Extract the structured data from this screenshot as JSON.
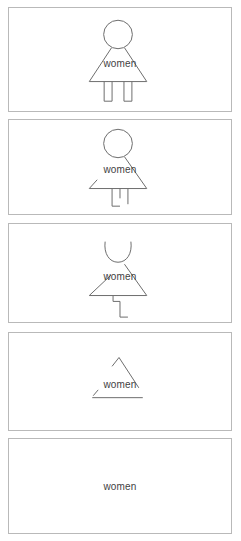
{
  "caption": {
    "text": "Sign fades",
    "note": "clipped at top edge of screenshot"
  },
  "colors": {
    "page_background": "#ffffff",
    "panel_border": "#b9b9b9",
    "figure_stroke": "#6e6e6e",
    "label_text": "#3f3f3f",
    "caption_text": "#4a4a4a"
  },
  "label": {
    "text": "women"
  },
  "frames": [
    {
      "index": 1,
      "name": "frame-complete",
      "label": "women",
      "description": "Complete pictogram: full circular head, full triangular dress, two full legs",
      "erosion_stage": "0% eroded",
      "parts_visible": [
        "head-circle-full",
        "dress-left-diagonal",
        "dress-right-diagonal",
        "dress-hem",
        "leg-left",
        "leg-right"
      ]
    },
    {
      "index": 2,
      "name": "frame-fading-1",
      "label": "women",
      "description": "Dress left diagonal reduced to short stub; legs thinned to strokes with one partial foot",
      "erosion_stage": "25% eroded",
      "parts_visible": [
        "head-circle-full",
        "dress-left-stub",
        "dress-right-diagonal",
        "dress-hem",
        "leg-strokes"
      ]
    },
    {
      "index": 3,
      "name": "frame-fading-2",
      "label": "women",
      "description": "Head circle broken open at the top; single L-shaped leg remnant remains",
      "erosion_stage": "50% eroded",
      "parts_visible": [
        "head-circle-broken",
        "dress-left-stub",
        "dress-right-diagonal",
        "dress-hem",
        "leg-single-remnant"
      ]
    },
    {
      "index": 4,
      "name": "frame-fading-3",
      "label": "women",
      "description": "Head gone; only a small peak, one diagonal, a tiny stub and the hem line remain",
      "erosion_stage": "80% eroded",
      "parts_visible": [
        "dress-peak-fragment",
        "dress-right-diagonal",
        "dress-left-tick",
        "dress-hem"
      ]
    },
    {
      "index": 5,
      "name": "frame-word-only",
      "label": "women",
      "description": "Figure fully erased; only the word remains",
      "erosion_stage": "100% eroded",
      "parts_visible": []
    }
  ]
}
